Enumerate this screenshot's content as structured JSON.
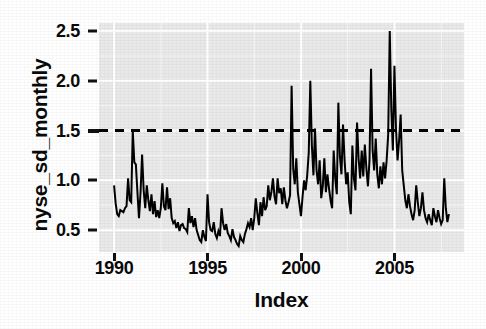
{
  "chart_data": {
    "type": "line",
    "title": "",
    "xlabel": "Index",
    "ylabel": "nyse_sd_monthly",
    "xlim": [
      1989.6,
      1989.6
    ],
    "ylim": [
      0.28,
      2.58
    ],
    "grid": true,
    "legend": null,
    "x_ticks": [
      1990,
      1995,
      2000,
      2005
    ],
    "x_tick_labels": [
      "1990",
      "1995",
      "2000",
      "2005"
    ],
    "y_ticks": [
      0.5,
      1.0,
      1.5,
      2.0,
      2.5
    ],
    "y_tick_labels": [
      "0.5",
      "1.0",
      "1.5",
      "2.0",
      "2.5"
    ],
    "annotations": [
      {
        "name": "threshold-line",
        "type": "hline",
        "value": 1.5,
        "style": "dashed",
        "color": "#000000"
      }
    ],
    "series": [
      {
        "name": "nyse_sd_monthly",
        "color": "#000000",
        "style": "solid",
        "x_start": 1990.0,
        "x_step": 0.0833,
        "values": [
          0.95,
          0.77,
          0.66,
          0.64,
          0.7,
          0.69,
          0.68,
          0.72,
          0.74,
          1.02,
          0.8,
          0.78,
          1.5,
          1.18,
          1.16,
          0.88,
          0.62,
          0.88,
          1.26,
          0.9,
          0.72,
          0.95,
          0.8,
          0.69,
          0.86,
          0.66,
          0.79,
          0.63,
          0.7,
          0.62,
          0.72,
          0.97,
          0.74,
          0.7,
          0.93,
          0.71,
          0.82,
          0.62,
          0.57,
          0.59,
          0.52,
          0.58,
          0.49,
          0.55,
          0.56,
          0.52,
          0.51,
          0.48,
          0.72,
          0.57,
          0.64,
          0.53,
          0.62,
          0.5,
          0.45,
          0.4,
          0.38,
          0.5,
          0.43,
          0.39,
          0.86,
          0.58,
          0.5,
          0.49,
          0.58,
          0.46,
          0.42,
          0.49,
          0.44,
          0.72,
          0.57,
          0.5,
          0.56,
          0.47,
          0.44,
          0.4,
          0.51,
          0.43,
          0.4,
          0.36,
          0.34,
          0.44,
          0.4,
          0.38,
          0.46,
          0.51,
          0.57,
          0.53,
          0.62,
          0.5,
          0.62,
          0.82,
          0.67,
          0.55,
          0.78,
          0.64,
          0.83,
          0.7,
          0.74,
          0.95,
          0.8,
          0.88,
          1.02,
          0.84,
          0.76,
          1.02,
          0.87,
          0.92,
          0.76,
          0.93,
          0.8,
          0.72,
          0.78,
          0.85,
          1.95,
          1.12,
          0.96,
          1.22,
          0.88,
          0.76,
          0.64,
          0.83,
          1.0,
          0.9,
          1.05,
          1.28,
          2.0,
          1.35,
          1.05,
          1.52,
          1.1,
          0.96,
          1.2,
          0.82,
          0.94,
          1.22,
          0.88,
          1.06,
          0.92,
          0.8,
          0.72,
          1.3,
          1.02,
          0.86,
          1.78,
          1.24,
          1.06,
          1.56,
          1.2,
          0.96,
          1.08,
          0.78,
          0.66,
          1.35,
          1.02,
          0.9,
          1.58,
          1.22,
          1.02,
          1.3,
          1.04,
          1.36,
          1.12,
          0.94,
          1.2,
          2.12,
          1.3,
          1.1,
          1.42,
          1.06,
          0.92,
          1.14,
          0.96,
          1.18,
          1.02,
          1.2,
          1.46,
          2.5,
          1.72,
          1.3,
          2.15,
          1.52,
          1.2,
          1.4,
          1.66,
          1.1,
          0.95,
          0.8,
          0.72,
          0.86,
          0.74,
          0.66,
          0.6,
          0.7,
          0.95,
          0.78,
          0.64,
          0.72,
          0.88,
          0.7,
          0.62,
          0.58,
          0.66,
          0.6,
          0.55,
          0.72,
          0.64,
          0.58,
          0.7,
          0.62,
          0.56,
          0.6,
          1.02,
          0.72,
          0.58,
          0.66
        ]
      }
    ]
  },
  "axis": {
    "y_title": "nyse_sd_monthly",
    "x_title": "Index"
  }
}
